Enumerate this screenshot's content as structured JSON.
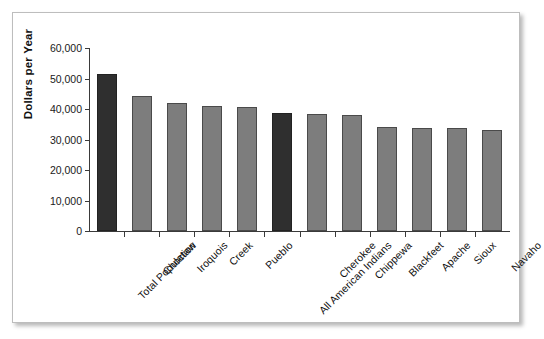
{
  "chart_data": {
    "type": "bar",
    "title": "",
    "xlabel": "",
    "ylabel": "Dollars per Year",
    "ylim": [
      0,
      60000
    ],
    "yticks": [
      "0",
      "10,000",
      "20,000",
      "30,000",
      "40,000",
      "50,000",
      "60,000"
    ],
    "ytick_values": [
      0,
      10000,
      20000,
      30000,
      40000,
      50000,
      60000
    ],
    "grid": false,
    "legend": "none",
    "categories": [
      "Total Population",
      "Choctaw",
      "Iroquois",
      "Creek",
      "Pueblo",
      "All American Indians",
      "Cherokee",
      "Chippewa",
      "Blackfeet",
      "Apache",
      "Sioux",
      "Navaho"
    ],
    "values": [
      51400,
      44200,
      42100,
      41000,
      40700,
      38600,
      38300,
      38000,
      34100,
      33900,
      33800,
      33200
    ],
    "bar_colors": [
      "#2f2f2f",
      "#7d7d7d",
      "#7d7d7d",
      "#7d7d7d",
      "#7d7d7d",
      "#2f2f2f",
      "#7d7d7d",
      "#7d7d7d",
      "#7d7d7d",
      "#7d7d7d",
      "#7d7d7d",
      "#7d7d7d"
    ],
    "highlight_color": "#2f2f2f",
    "series_color": "#7d7d7d"
  }
}
